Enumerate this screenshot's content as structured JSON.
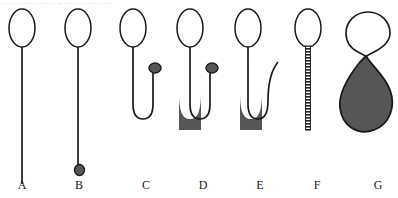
{
  "figure": {
    "caption_strip_text": ". . .  .. .   . .. . ... .  .  . .. . .. .  .   . ... . . .. ..",
    "background_color": "#ffffff",
    "stroke_color": "#1a1a1a",
    "fill_color": "#565656",
    "panels": [
      {
        "label": "A",
        "name": "empty-loop-straight-stem",
        "loop_filled": false,
        "stem_type": "straight",
        "stem_texture": "plain",
        "has_terminal_dot": false,
        "fill_present": false
      },
      {
        "label": "B",
        "name": "loop-stem-with-terminal-dot",
        "loop_filled": false,
        "stem_type": "straight",
        "stem_texture": "plain",
        "has_terminal_dot": true,
        "fill_present": false
      },
      {
        "label": "C",
        "name": "u-tube-empty-with-dot",
        "loop_filled": false,
        "stem_type": "u-tube",
        "stem_texture": "plain",
        "has_terminal_dot": true,
        "fill_present": false
      },
      {
        "label": "D",
        "name": "u-tube-filled-with-dot",
        "loop_filled": false,
        "stem_type": "u-tube",
        "stem_texture": "plain",
        "has_terminal_dot": true,
        "fill_present": true
      },
      {
        "label": "E",
        "name": "u-tube-filled-open-arm",
        "loop_filled": false,
        "stem_type": "u-tube-curved-open",
        "stem_texture": "plain",
        "has_terminal_dot": false,
        "fill_present": true
      },
      {
        "label": "F",
        "name": "loop-with-ladder-stem",
        "loop_filled": false,
        "stem_type": "straight-short",
        "stem_texture": "ladder",
        "has_terminal_dot": false,
        "fill_present": false
      },
      {
        "label": "G",
        "name": "figure-eight-filled-teardrop",
        "loop_filled": false,
        "stem_type": "none",
        "stem_texture": "none",
        "has_terminal_dot": false,
        "fill_present": true
      }
    ]
  }
}
